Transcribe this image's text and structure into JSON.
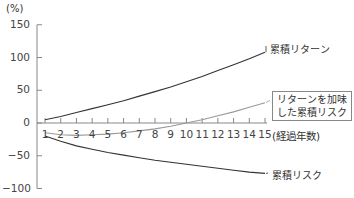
{
  "chart_data": {
    "type": "line",
    "title": "",
    "ylabel": "(%)",
    "xlabel": "(経過年数)",
    "x": [
      1,
      2,
      3,
      4,
      5,
      6,
      7,
      8,
      9,
      10,
      11,
      12,
      13,
      14,
      15
    ],
    "ylim": [
      -100,
      150
    ],
    "yticks": [
      "150",
      "100",
      "50",
      "0",
      "−50",
      "−100"
    ],
    "ytick_values": [
      150,
      100,
      50,
      0,
      -50,
      -100
    ],
    "xtick_labels": [
      "1",
      "2",
      "3",
      "4",
      "5",
      "6",
      "7",
      "8",
      "9",
      "10",
      "11",
      "12",
      "13",
      "14",
      "15"
    ],
    "grid": false,
    "series": [
      {
        "name": "累積リターン",
        "color": "#333333",
        "values": [
          5,
          10,
          16,
          22,
          28,
          34,
          41,
          48,
          55,
          63,
          71,
          80,
          89,
          98,
          108
        ]
      },
      {
        "name": "リターンを加味した累積リスク",
        "color": "#999999",
        "values": [
          -15,
          -18,
          -19,
          -18,
          -17,
          -15,
          -12,
          -9,
          -5,
          0,
          5,
          11,
          17,
          24,
          31
        ]
      },
      {
        "name": "累積リスク",
        "color": "#333333",
        "values": [
          -20,
          -28,
          -35,
          -40,
          -45,
          -49,
          -53,
          -57,
          -60,
          -63,
          -66,
          -69,
          -72,
          -75,
          -77
        ]
      }
    ],
    "annotations": [
      "累積リターン",
      "リターンを加味\nした累積リスク",
      "累積リスク"
    ]
  },
  "labels": {
    "y_unit": "(%)",
    "x_unit": "(経過年数)",
    "series_return": "累積リターン",
    "series_adjusted_line1": "リターンを加味",
    "series_adjusted_line2": "した累積リスク",
    "series_risk": "累積リスク"
  }
}
